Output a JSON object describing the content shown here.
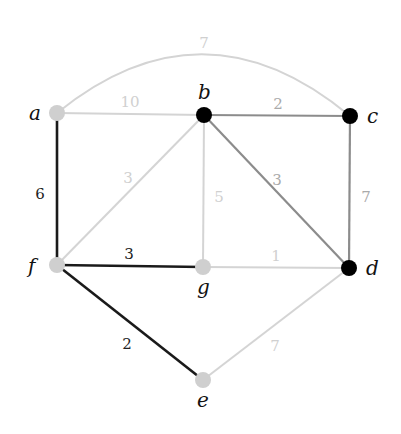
{
  "diagram": {
    "type": "weighted-undirected-graph",
    "colors": {
      "background": "#ffffff",
      "tree_edge": "#1a1a1a",
      "mid_edge": "#8c8c8c",
      "light_edge": "#d4d4d4",
      "dark_node": "#000000",
      "light_node": "#cfcfcf",
      "dark_label": "#222222",
      "mid_label": "#aaaaaa",
      "light_label": "#d0d0d0"
    },
    "nodes": [
      {
        "id": "a",
        "label": "a",
        "x": 57,
        "y": 113,
        "style": "light",
        "lx": 29,
        "ly": 120
      },
      {
        "id": "b",
        "label": "b",
        "x": 204,
        "y": 115,
        "style": "dark",
        "lx": 198,
        "ly": 99
      },
      {
        "id": "c",
        "label": "c",
        "x": 350,
        "y": 116,
        "style": "dark",
        "lx": 367,
        "ly": 123
      },
      {
        "id": "d",
        "label": "d",
        "x": 349,
        "y": 268,
        "style": "dark",
        "lx": 366,
        "ly": 275
      },
      {
        "id": "f",
        "label": "f",
        "x": 57,
        "y": 265,
        "style": "light",
        "lx": 28,
        "ly": 273
      },
      {
        "id": "g",
        "label": "g",
        "x": 203,
        "y": 267,
        "style": "light",
        "lx": 197,
        "ly": 294
      },
      {
        "id": "e",
        "label": "e",
        "x": 203,
        "y": 380,
        "style": "light",
        "lx": 197,
        "ly": 407
      }
    ],
    "edges": [
      {
        "from": "a",
        "to": "c",
        "weight": "7",
        "style": "light",
        "curved": true,
        "wx": 204,
        "wy": 43
      },
      {
        "from": "a",
        "to": "b",
        "weight": "10",
        "style": "light",
        "wx": 130,
        "wy": 102
      },
      {
        "from": "b",
        "to": "c",
        "weight": "2",
        "style": "mid",
        "wx": 278,
        "wy": 104
      },
      {
        "from": "a",
        "to": "f",
        "weight": "6",
        "style": "dark",
        "wx": 40,
        "wy": 194
      },
      {
        "from": "b",
        "to": "f",
        "weight": "3",
        "style": "light",
        "wx": 128,
        "wy": 178
      },
      {
        "from": "b",
        "to": "g",
        "weight": "5",
        "style": "light",
        "wx": 219,
        "wy": 197
      },
      {
        "from": "b",
        "to": "d",
        "weight": "3",
        "style": "mid",
        "wx": 277,
        "wy": 180
      },
      {
        "from": "c",
        "to": "d",
        "weight": "7",
        "style": "mid",
        "wx": 366,
        "wy": 197
      },
      {
        "from": "f",
        "to": "g",
        "weight": "3",
        "style": "dark",
        "wx": 129,
        "wy": 254
      },
      {
        "from": "g",
        "to": "d",
        "weight": "1",
        "style": "light",
        "wx": 276,
        "wy": 256
      },
      {
        "from": "f",
        "to": "e",
        "weight": "2",
        "style": "dark",
        "wx": 127,
        "wy": 344
      },
      {
        "from": "e",
        "to": "d",
        "weight": "7",
        "style": "light",
        "wx": 275,
        "wy": 346
      }
    ]
  }
}
